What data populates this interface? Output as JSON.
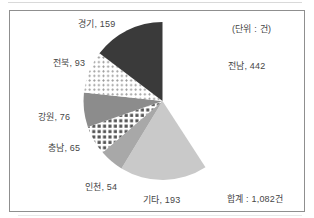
{
  "chart_data": {
    "type": "pie",
    "unit_note": "(단위 : 건)",
    "total_label": "합계 : 1,082건",
    "total_value": 1082,
    "start_angle_deg": 0,
    "direction": "clockwise",
    "legend": "none",
    "slices": [
      {
        "name": "전남",
        "value": 442,
        "label": "전남, 442",
        "fill": "#ffffff"
      },
      {
        "name": "기타",
        "value": 193,
        "label": "기타, 193",
        "fill": "#c9c9c9"
      },
      {
        "name": "인천",
        "value": 54,
        "label": "인천, 54",
        "fill": "#a8a8a8"
      },
      {
        "name": "충남",
        "value": 65,
        "label": "충남, 65",
        "fill": "pattern:checker"
      },
      {
        "name": "강원",
        "value": 76,
        "label": "강원, 76",
        "fill": "#8c8c8c"
      },
      {
        "name": "전북",
        "value": 93,
        "label": "전북, 93",
        "fill": "pattern:dots"
      },
      {
        "name": "경기",
        "value": 159,
        "label": "경기, 159",
        "fill": "#3a3a3a"
      }
    ],
    "pattern_colors": {
      "checker_fg": "#545454",
      "dots_fg": "#9a9a9a",
      "pattern_bg": "#ffffff"
    },
    "frame_border_color": "#8f8f8f",
    "text_color": "#464646"
  }
}
